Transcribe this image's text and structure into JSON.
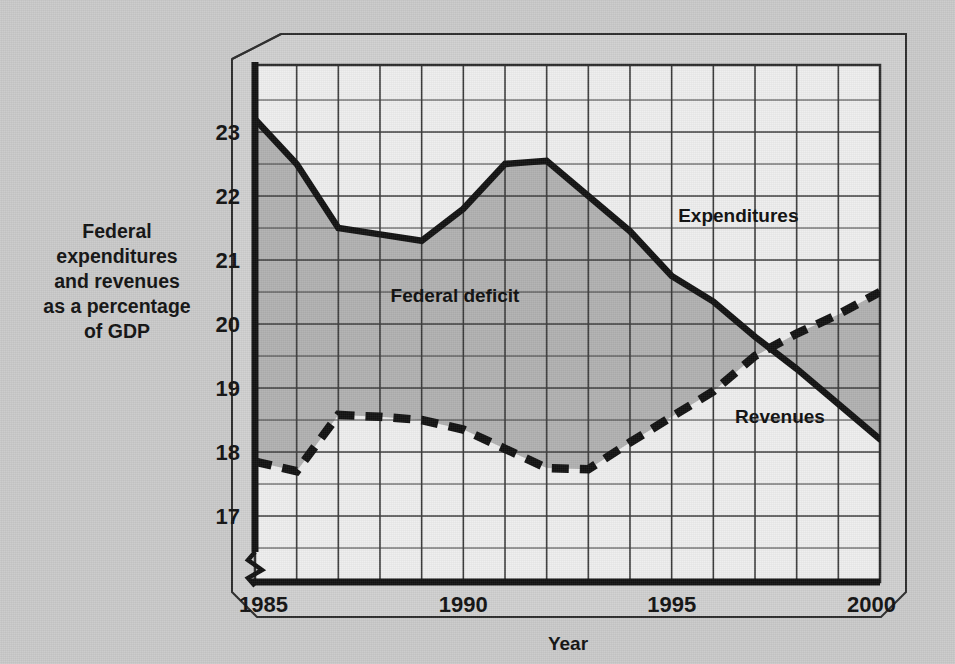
{
  "chart_data": {
    "type": "line",
    "title": "",
    "subtitle": "",
    "xlabel": "Year",
    "ylabel": "Federal expenditures and revenues as a percentage of GDP",
    "ylabel_lines": [
      "Federal",
      "expenditures",
      "and revenues",
      "as a percentage",
      "of GDP"
    ],
    "x": [
      1985,
      1986,
      1987,
      1988,
      1989,
      1990,
      1991,
      1992,
      1993,
      1994,
      1995,
      1996,
      1997,
      1998,
      1999,
      2000
    ],
    "xtick_labels": [
      "1985",
      "1990",
      "1995",
      "2000"
    ],
    "xtick_values": [
      1985,
      1990,
      1995,
      2000
    ],
    "ytick_labels": [
      "17",
      "18",
      "19",
      "20",
      "21",
      "22",
      "23"
    ],
    "ytick_values": [
      17,
      18,
      19,
      20,
      21,
      22,
      23
    ],
    "xlim": [
      1985,
      2000
    ],
    "ylim": [
      16.6,
      23.7
    ],
    "y_axis_break": true,
    "grid": true,
    "grid_x_step": 1,
    "grid_y_step": 0.5,
    "legend": "inline-annotations",
    "series": [
      {
        "name": "Expenditures",
        "style": "solid",
        "color": "#111111",
        "values": [
          23.2,
          22.5,
          21.5,
          21.4,
          21.3,
          21.8,
          22.5,
          22.55,
          22.0,
          21.45,
          20.75,
          20.35,
          19.8,
          19.3,
          18.75,
          18.2
        ]
      },
      {
        "name": "Revenues",
        "style": "dashed",
        "color": "#111111",
        "values": [
          17.85,
          17.7,
          18.58,
          18.55,
          18.5,
          18.35,
          18.05,
          17.75,
          17.73,
          18.15,
          18.55,
          18.95,
          19.5,
          19.85,
          20.15,
          20.5
        ]
      }
    ],
    "annotations": [
      {
        "text": "Federal deficit",
        "x": 1989.8,
        "y": 20.35,
        "name": "federal-deficit-label"
      },
      {
        "text": "Expenditures",
        "x": 1996.6,
        "y": 21.6,
        "name": "expenditures-label"
      },
      {
        "text": "Revenues",
        "x": 1997.6,
        "y": 18.45,
        "name": "revenues-label"
      }
    ],
    "shaded_region": {
      "label": "Federal deficit",
      "between": [
        "Expenditures",
        "Revenues"
      ],
      "color": "#b0b0b0"
    },
    "colors": {
      "background": "#c9c9c9",
      "plot_area": "#ededed",
      "deficit_fill": "#b0b0b0",
      "line": "#111111",
      "grid": "#3a3a3a",
      "frame": "#2b2b2b"
    }
  }
}
